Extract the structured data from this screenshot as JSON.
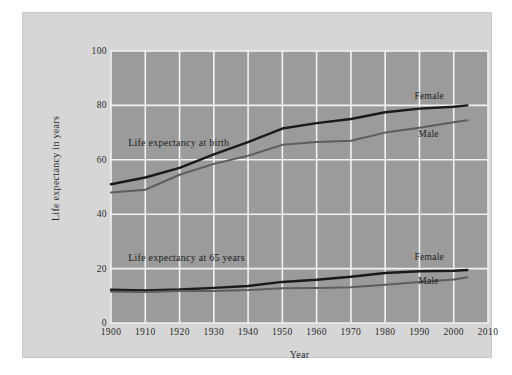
{
  "figure": {
    "background_color": "#ffffff",
    "card_color": "#d6d6d6",
    "plot_background_color": "#9b9b9b",
    "grid_color": "#f2f2f2"
  },
  "chart_data": {
    "type": "line",
    "title": "",
    "xlabel": "Year",
    "ylabel": "Life expectancy in years",
    "xlim": [
      1900,
      2010
    ],
    "ylim": [
      0,
      100
    ],
    "xticks": [
      1900,
      1910,
      1920,
      1930,
      1940,
      1950,
      1960,
      1970,
      1980,
      1990,
      2000,
      2010
    ],
    "yticks": [
      0,
      20,
      40,
      60,
      80,
      100
    ],
    "grid": true,
    "legend_position": "inline-end-of-line",
    "annotations": [
      {
        "text": "Life expectancy at birth",
        "x": 1905,
        "y": 66
      },
      {
        "text": "Life expectancy at 65 years",
        "x": 1905,
        "y": 24
      }
    ],
    "x": [
      1900,
      1910,
      1920,
      1930,
      1940,
      1950,
      1960,
      1970,
      1980,
      1990,
      2000,
      2004
    ],
    "series": [
      {
        "name": "Female",
        "group": "Life expectancy at birth",
        "color": "#1a1a1a",
        "label": "Female",
        "label_x": 1995,
        "label_y": 83,
        "values": [
          51.0,
          53.5,
          57.0,
          62.0,
          66.5,
          71.5,
          73.5,
          75.0,
          77.5,
          78.8,
          79.5,
          80.0
        ]
      },
      {
        "name": "Male",
        "group": "Life expectancy at birth",
        "color": "#5e5e5e",
        "label": "Male",
        "label_x": 1992,
        "label_y": 69,
        "values": [
          48.0,
          49.0,
          54.5,
          58.5,
          61.5,
          65.5,
          66.5,
          67.0,
          70.0,
          71.8,
          73.8,
          74.5
        ]
      },
      {
        "name": "Female",
        "group": "Life expectancy at 65 years",
        "color": "#1a1a1a",
        "label": "Female",
        "label_x": 1995,
        "label_y": 24,
        "values": [
          12.2,
          12.0,
          12.3,
          12.9,
          13.6,
          15.1,
          15.9,
          17.0,
          18.4,
          19.0,
          19.2,
          19.5
        ]
      },
      {
        "name": "Male",
        "group": "Life expectancy at 65 years",
        "color": "#5e5e5e",
        "label": "Male",
        "label_x": 1992,
        "label_y": 15,
        "values": [
          11.5,
          11.4,
          11.8,
          11.8,
          12.1,
          12.8,
          12.9,
          13.1,
          14.1,
          15.1,
          16.0,
          16.8
        ]
      }
    ]
  },
  "axis": {
    "y_title": "Life expectancy in years",
    "x_title": "Year",
    "y_tick_labels": [
      "0",
      "20",
      "40",
      "60",
      "80",
      "100"
    ],
    "x_tick_labels": [
      "1900",
      "1910",
      "1920",
      "1930",
      "1940",
      "1950",
      "1960",
      "1970",
      "1980",
      "1990",
      "2000",
      "2010"
    ]
  },
  "annotations": {
    "birth": "Life expectancy at birth",
    "at65": "Life expectancy at 65 years"
  },
  "series_labels": {
    "birth_female": "Female",
    "birth_male": "Male",
    "at65_female": "Female",
    "at65_male": "Male"
  }
}
